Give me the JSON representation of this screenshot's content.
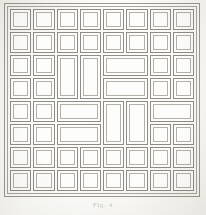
{
  "figure": {
    "kind": "panelled-grid-plate",
    "caption": "Fig. 4",
    "frame": {
      "style": "double-rule-border",
      "outer_color": "#9b9891",
      "inner_color": "#aaa69e"
    },
    "grid": {
      "columns": 8,
      "rows": 8,
      "cell_border_outer_color": "#8f8c85",
      "cell_border_inner_color": "#b4b0a8",
      "cell_fill": "#fdfdfc",
      "background": "#fdfdfb",
      "gap_px": 2
    },
    "cells": [
      {
        "name": "panel-r1c1",
        "col": 1,
        "row": 1,
        "colspan": 1,
        "rowspan": 1
      },
      {
        "name": "panel-r1c2",
        "col": 2,
        "row": 1,
        "colspan": 1,
        "rowspan": 1
      },
      {
        "name": "panel-r1c3",
        "col": 3,
        "row": 1,
        "colspan": 1,
        "rowspan": 1
      },
      {
        "name": "panel-r1c4",
        "col": 4,
        "row": 1,
        "colspan": 1,
        "rowspan": 1
      },
      {
        "name": "panel-r1c5",
        "col": 5,
        "row": 1,
        "colspan": 1,
        "rowspan": 1
      },
      {
        "name": "panel-r1c6",
        "col": 6,
        "row": 1,
        "colspan": 1,
        "rowspan": 1
      },
      {
        "name": "panel-r1c7",
        "col": 7,
        "row": 1,
        "colspan": 1,
        "rowspan": 1
      },
      {
        "name": "panel-r1c8",
        "col": 8,
        "row": 1,
        "colspan": 1,
        "rowspan": 1
      },
      {
        "name": "panel-r2c1",
        "col": 1,
        "row": 2,
        "colspan": 1,
        "rowspan": 1
      },
      {
        "name": "panel-r2c2",
        "col": 2,
        "row": 2,
        "colspan": 1,
        "rowspan": 1
      },
      {
        "name": "panel-r2c3",
        "col": 3,
        "row": 2,
        "colspan": 1,
        "rowspan": 1
      },
      {
        "name": "panel-r2c4",
        "col": 4,
        "row": 2,
        "colspan": 1,
        "rowspan": 1
      },
      {
        "name": "panel-r2c5",
        "col": 5,
        "row": 2,
        "colspan": 1,
        "rowspan": 1
      },
      {
        "name": "panel-r2c6",
        "col": 6,
        "row": 2,
        "colspan": 1,
        "rowspan": 1
      },
      {
        "name": "panel-r2c7",
        "col": 7,
        "row": 2,
        "colspan": 1,
        "rowspan": 1
      },
      {
        "name": "panel-r2c8",
        "col": 8,
        "row": 2,
        "colspan": 1,
        "rowspan": 1
      },
      {
        "name": "panel-r3c1",
        "col": 1,
        "row": 3,
        "colspan": 1,
        "rowspan": 1
      },
      {
        "name": "panel-r3c2",
        "col": 2,
        "row": 3,
        "colspan": 1,
        "rowspan": 1
      },
      {
        "name": "panel-r3c3-tall",
        "col": 3,
        "row": 3,
        "colspan": 1,
        "rowspan": 2
      },
      {
        "name": "panel-r3c4-tall",
        "col": 4,
        "row": 3,
        "colspan": 1,
        "rowspan": 2
      },
      {
        "name": "panel-r3c5-wide",
        "col": 5,
        "row": 3,
        "colspan": 2,
        "rowspan": 1
      },
      {
        "name": "panel-r3c7",
        "col": 7,
        "row": 3,
        "colspan": 1,
        "rowspan": 1
      },
      {
        "name": "panel-r3c8",
        "col": 8,
        "row": 3,
        "colspan": 1,
        "rowspan": 1
      },
      {
        "name": "panel-r4c1",
        "col": 1,
        "row": 4,
        "colspan": 1,
        "rowspan": 1
      },
      {
        "name": "panel-r4c2",
        "col": 2,
        "row": 4,
        "colspan": 1,
        "rowspan": 1
      },
      {
        "name": "panel-r4c5-wide",
        "col": 5,
        "row": 4,
        "colspan": 2,
        "rowspan": 1
      },
      {
        "name": "panel-r4c7",
        "col": 7,
        "row": 4,
        "colspan": 1,
        "rowspan": 1
      },
      {
        "name": "panel-r4c8",
        "col": 8,
        "row": 4,
        "colspan": 1,
        "rowspan": 1
      },
      {
        "name": "panel-r5c1",
        "col": 1,
        "row": 5,
        "colspan": 1,
        "rowspan": 1
      },
      {
        "name": "panel-r5c2",
        "col": 2,
        "row": 5,
        "colspan": 1,
        "rowspan": 1
      },
      {
        "name": "panel-r5c3-wide",
        "col": 3,
        "row": 5,
        "colspan": 2,
        "rowspan": 1
      },
      {
        "name": "panel-r5c5-tall",
        "col": 5,
        "row": 5,
        "colspan": 1,
        "rowspan": 2
      },
      {
        "name": "panel-r5c6-tall",
        "col": 6,
        "row": 5,
        "colspan": 1,
        "rowspan": 2
      },
      {
        "name": "panel-r5c7-wide",
        "col": 7,
        "row": 5,
        "colspan": 2,
        "rowspan": 1
      },
      {
        "name": "panel-r6c1",
        "col": 1,
        "row": 6,
        "colspan": 1,
        "rowspan": 1
      },
      {
        "name": "panel-r6c2",
        "col": 2,
        "row": 6,
        "colspan": 1,
        "rowspan": 1
      },
      {
        "name": "panel-r6c3-wide",
        "col": 3,
        "row": 6,
        "colspan": 2,
        "rowspan": 1
      },
      {
        "name": "panel-r6c7",
        "col": 7,
        "row": 6,
        "colspan": 1,
        "rowspan": 1
      },
      {
        "name": "panel-r6c8",
        "col": 8,
        "row": 6,
        "colspan": 1,
        "rowspan": 1
      },
      {
        "name": "panel-r7c1",
        "col": 1,
        "row": 7,
        "colspan": 1,
        "rowspan": 1
      },
      {
        "name": "panel-r7c2",
        "col": 2,
        "row": 7,
        "colspan": 1,
        "rowspan": 1
      },
      {
        "name": "panel-r7c3",
        "col": 3,
        "row": 7,
        "colspan": 1,
        "rowspan": 1
      },
      {
        "name": "panel-r7c4",
        "col": 4,
        "row": 7,
        "colspan": 1,
        "rowspan": 1
      },
      {
        "name": "panel-r7c5",
        "col": 5,
        "row": 7,
        "colspan": 1,
        "rowspan": 1
      },
      {
        "name": "panel-r7c6",
        "col": 6,
        "row": 7,
        "colspan": 1,
        "rowspan": 1
      },
      {
        "name": "panel-r7c7",
        "col": 7,
        "row": 7,
        "colspan": 1,
        "rowspan": 1
      },
      {
        "name": "panel-r7c8",
        "col": 8,
        "row": 7,
        "colspan": 1,
        "rowspan": 1
      },
      {
        "name": "panel-r8c1",
        "col": 1,
        "row": 8,
        "colspan": 1,
        "rowspan": 1
      },
      {
        "name": "panel-r8c2",
        "col": 2,
        "row": 8,
        "colspan": 1,
        "rowspan": 1
      },
      {
        "name": "panel-r8c3",
        "col": 3,
        "row": 8,
        "colspan": 1,
        "rowspan": 1
      },
      {
        "name": "panel-r8c4",
        "col": 4,
        "row": 8,
        "colspan": 1,
        "rowspan": 1
      },
      {
        "name": "panel-r8c5",
        "col": 5,
        "row": 8,
        "colspan": 1,
        "rowspan": 1
      },
      {
        "name": "panel-r8c6",
        "col": 6,
        "row": 8,
        "colspan": 1,
        "rowspan": 1
      },
      {
        "name": "panel-r8c7",
        "col": 7,
        "row": 8,
        "colspan": 1,
        "rowspan": 1
      },
      {
        "name": "panel-r8c8",
        "col": 8,
        "row": 8,
        "colspan": 1,
        "rowspan": 1
      }
    ]
  }
}
